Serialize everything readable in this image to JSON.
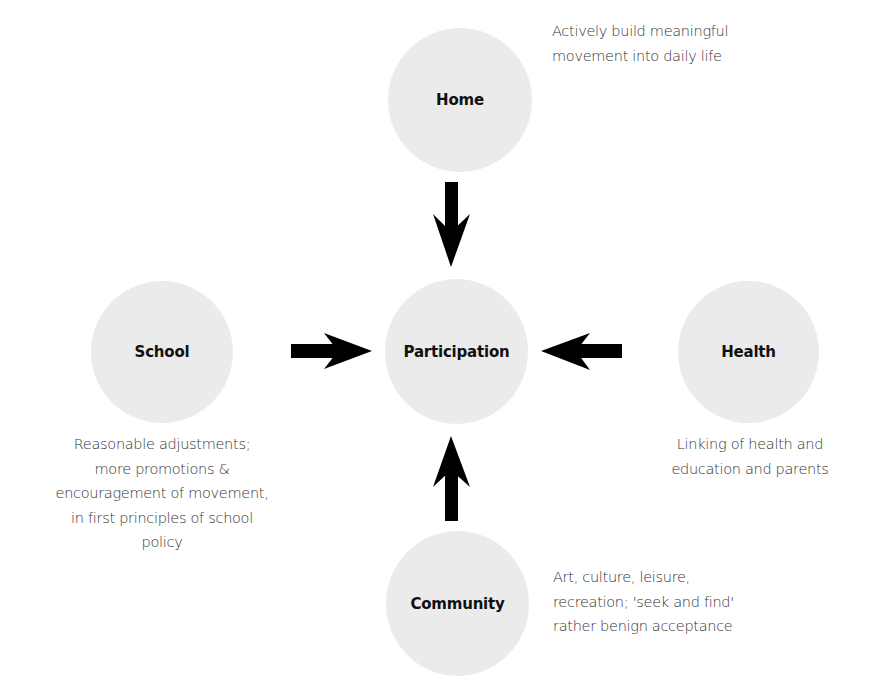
{
  "diagram": {
    "center": {
      "label": "Participation"
    },
    "nodes": [
      {
        "id": "home",
        "label": "Home",
        "description": [
          "Actively build meaningful",
          "movement into daily life"
        ]
      },
      {
        "id": "school",
        "label": "School",
        "description": [
          "Reasonable adjustments;",
          "more promotions &",
          "encouragement of movement,",
          "in first principles of school",
          "policy"
        ]
      },
      {
        "id": "health",
        "label": "Health",
        "description": [
          "Linking of health and",
          "education and parents"
        ]
      },
      {
        "id": "community",
        "label": "Community",
        "description": [
          "Art, culture, leisure,",
          "recreation; 'seek and find'",
          "rather benign acceptance"
        ]
      }
    ],
    "edges": [
      {
        "from": "Home",
        "to": "Participation",
        "direction": "down"
      },
      {
        "from": "School",
        "to": "Participation",
        "direction": "right"
      },
      {
        "from": "Health",
        "to": "Participation",
        "direction": "left"
      },
      {
        "from": "Community",
        "to": "Participation",
        "direction": "up"
      }
    ],
    "colors": {
      "node_fill": "#ebebeb",
      "arrow": "#000000",
      "text": "#333333"
    }
  }
}
